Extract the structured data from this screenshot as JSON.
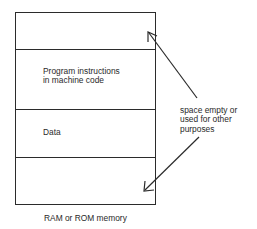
{
  "diagram": {
    "memory_block": {
      "segments": [
        {
          "label": ""
        },
        {
          "label_line1": "Program instructions",
          "label_line2": "in machine code"
        },
        {
          "label": "Data"
        },
        {
          "label": ""
        }
      ],
      "caption": "RAM or ROM memory"
    },
    "annotation": {
      "line1": "space empty or",
      "line2": "used for other",
      "line3": "purposes"
    },
    "colors": {
      "line": "#2b2b2b",
      "background": "#ffffff"
    }
  }
}
